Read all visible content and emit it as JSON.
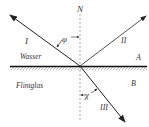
{
  "diagram": {
    "type": "optics-refraction-reflection",
    "labels": {
      "normal": "N",
      "incident_ray": "I",
      "reflected_ray": "II",
      "refracted_ray": "III",
      "medium_top": "Wasser",
      "medium_bottom": "Flintglas",
      "region_top": "A",
      "region_bottom": "B",
      "incidence_angle": "φ",
      "refraction_angle": "χ"
    },
    "colors": {
      "line": "#222222",
      "normal": "#999999",
      "background": "#ffffff"
    }
  }
}
